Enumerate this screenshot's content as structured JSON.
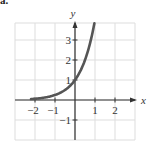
{
  "panel_label": "a.",
  "chart_data": {
    "type": "line",
    "title": "",
    "function": "y = 4^x",
    "xlabel": "x",
    "ylabel": "y",
    "xlim": [
      -3,
      3
    ],
    "ylim": [
      -2,
      3.85
    ],
    "grid": true,
    "x_ticks": [
      {
        "value": -2,
        "label": "−2"
      },
      {
        "value": -1,
        "label": "−1"
      },
      {
        "value": 1,
        "label": "1"
      },
      {
        "value": 2,
        "label": "2"
      }
    ],
    "y_ticks": [
      {
        "value": 3,
        "label": "3"
      },
      {
        "value": 2,
        "label": "2"
      },
      {
        "value": 1,
        "label": "1"
      },
      {
        "value": -1,
        "label": "−1"
      }
    ],
    "series": [
      {
        "name": "curve",
        "x": [
          -2.2,
          -2,
          -1.5,
          -1,
          -0.5,
          0,
          0.25,
          0.5,
          0.75,
          0.97
        ],
        "y": [
          0.05,
          0.0625,
          0.125,
          0.25,
          0.5,
          1,
          1.41,
          2,
          2.83,
          3.84
        ]
      }
    ],
    "colors": {
      "curve": "#555555",
      "axes": "#333333",
      "grid": "#dddddd"
    }
  }
}
